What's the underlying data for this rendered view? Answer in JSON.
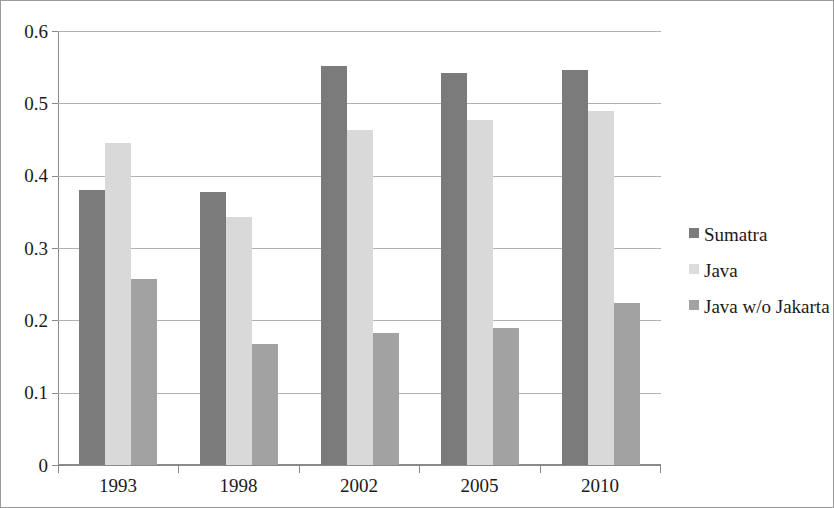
{
  "chart_data": {
    "type": "bar",
    "title": "",
    "subtitle": "",
    "xlabel": "",
    "ylabel": "",
    "categories": [
      "1993",
      "1998",
      "2002",
      "2005",
      "2010"
    ],
    "series": [
      {
        "name": "Sumatra",
        "color": "#7b7b7b",
        "values": [
          0.38,
          0.377,
          0.551,
          0.542,
          0.546
        ]
      },
      {
        "name": "Java",
        "color": "#d9d9d9",
        "values": [
          0.445,
          0.343,
          0.463,
          0.477,
          0.489
        ]
      },
      {
        "name": "Java w/o Jakarta",
        "color": "#a2a2a2",
        "values": [
          0.257,
          0.168,
          0.183,
          0.189,
          0.224
        ]
      }
    ],
    "ylim": [
      0,
      0.6
    ],
    "y_ticks": [
      "0",
      "0.1",
      "0.2",
      "0.3",
      "0.4",
      "0.5",
      "0.6"
    ],
    "y_tick_values": [
      0,
      0.1,
      0.2,
      0.3,
      0.4,
      0.5,
      0.6
    ],
    "grid": "horizontal",
    "legend_position": "right",
    "legend": [
      "Sumatra",
      "Java",
      "Java w/o Jakarta"
    ]
  },
  "axis": {
    "y_labels": [
      "0.6",
      "0.5",
      "0.4",
      "0.3",
      "0.2",
      "0.1",
      "0"
    ],
    "x_labels": [
      "1993",
      "1998",
      "2002",
      "2005",
      "2010"
    ]
  },
  "legend": {
    "items": [
      {
        "label": "Sumatra"
      },
      {
        "label": "Java"
      },
      {
        "label": "Java w/o Jakarta"
      }
    ]
  }
}
